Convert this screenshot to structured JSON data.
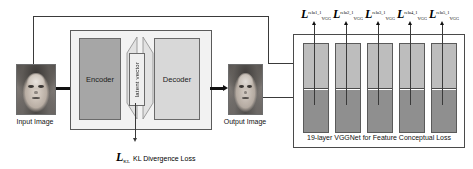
{
  "figure": {
    "background_color": "#ffffff",
    "width": 473,
    "height": 169
  },
  "input": {
    "caption": "Input Image",
    "thumbnail_name": "face-photo-grayscale"
  },
  "output": {
    "caption": "Output Image",
    "thumbnail_name": "reconstructed-face-photo-grayscale"
  },
  "vae": {
    "encoder_label": "Encoder",
    "latent_label": "latent vector",
    "decoder_label": "Decoder",
    "encoder_color": "#a6a6a6",
    "decoder_color": "#d8d8d8",
    "box_color": "#f2f2f2"
  },
  "kl_loss": {
    "symbol": "L",
    "subscript": "KL",
    "text": "KL Divergence Loss"
  },
  "vgg": {
    "caption": "19-layer VGGNet for Feature Conceptual Loss",
    "bar_top_color": "#bdbdbd",
    "bar_bottom_color": "#8f8f8f",
    "losses": [
      {
        "symbol": "L",
        "subscript": "VGG",
        "superscript": "relu1_1"
      },
      {
        "symbol": "L",
        "subscript": "VGG",
        "superscript": "relu2_1"
      },
      {
        "symbol": "L",
        "subscript": "VGG",
        "superscript": "relu3_1"
      },
      {
        "symbol": "L",
        "subscript": "VGG",
        "superscript": "relu4_1"
      },
      {
        "symbol": "L",
        "subscript": "VGG",
        "superscript": "relu5_1"
      }
    ]
  }
}
